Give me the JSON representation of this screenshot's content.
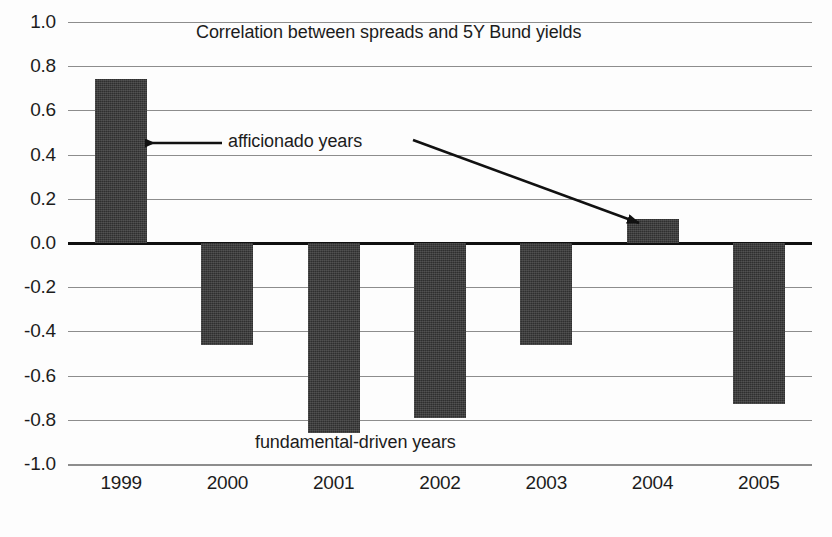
{
  "chart_data": {
    "type": "bar",
    "title": "Correlation between spreads and 5Y Bund yields",
    "xlabel": "",
    "ylabel": "",
    "categories": [
      "1999",
      "2000",
      "2001",
      "2002",
      "2003",
      "2004",
      "2005"
    ],
    "values": [
      0.74,
      -0.46,
      -0.86,
      -0.79,
      -0.46,
      0.11,
      -0.73
    ],
    "series": [
      {
        "name": "Correlation between spreads and 5Y Bund yields",
        "values": [
          0.74,
          -0.46,
          -0.86,
          -0.79,
          -0.46,
          0.11,
          -0.73
        ]
      }
    ],
    "ylim": [
      -1.0,
      1.0
    ],
    "yticks": [
      1.0,
      0.8,
      0.6,
      0.4,
      0.2,
      0.0,
      -0.2,
      -0.4,
      -0.6,
      -0.8,
      -1.0
    ],
    "ytick_labels": [
      "1.0",
      "0.8",
      "0.6",
      "0.4",
      "0.2",
      "0.0",
      "-0.2",
      "-0.4",
      "-0.6",
      "-0.8",
      "-1.0"
    ],
    "grid": true,
    "legend": false,
    "bar_color": "#2f2f2f",
    "gridline_color": "#8d8d8d",
    "zero_line_color": "#101010",
    "annotations": [
      {
        "id": "afficionado",
        "text": "afficionado years",
        "points_to_category": "1999"
      },
      {
        "id": "fundamental",
        "text": "fundamental-driven years",
        "points_to_category": "2004"
      }
    ]
  },
  "axes": {
    "y_tick_labels": [
      "1.0",
      "0.8",
      "0.6",
      "0.4",
      "0.2",
      "0.0",
      "-0.2",
      "-0.4",
      "-0.6",
      "-0.8",
      "-1.0"
    ],
    "x_tick_labels": [
      "1999",
      "2000",
      "2001",
      "2002",
      "2003",
      "2004",
      "2005"
    ]
  },
  "title": {
    "text": "Correlation between spreads and 5Y Bund yields"
  },
  "annotations": {
    "afficionado": "afficionado years",
    "fundamental": "fundamental-driven years"
  },
  "caption": {
    "text": ""
  }
}
